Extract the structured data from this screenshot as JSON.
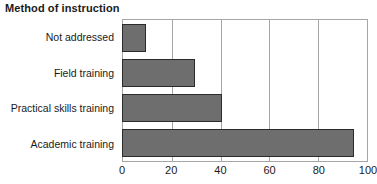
{
  "chart_data": {
    "type": "bar",
    "orientation": "horizontal",
    "title": "Method of instruction",
    "categories": [
      "Not addressed",
      "Field training",
      "Practical skills training",
      "Academic training"
    ],
    "values": [
      10,
      30,
      41,
      95
    ],
    "series": [
      {
        "name": "Method of instruction",
        "values": [
          10,
          30,
          41,
          95
        ]
      }
    ],
    "xlabel": "",
    "ylabel": "",
    "xlim": [
      0,
      100
    ],
    "xticks": [
      0,
      20,
      40,
      60,
      80,
      100
    ],
    "xtick_labels": [
      "0",
      "20",
      "40",
      "60",
      "80",
      "100"
    ],
    "gridlines": {
      "vertical": true,
      "horizontal": false,
      "at": [
        20,
        40,
        60,
        80
      ]
    },
    "legend": null,
    "colors": {
      "bar_fill": "#6e6e6e",
      "bar_stroke": "#2b2b2b",
      "grid": "#a6a6a6",
      "axis": "#a6a6a6",
      "text": "#1a1a1a",
      "background": "#ffffff"
    }
  }
}
